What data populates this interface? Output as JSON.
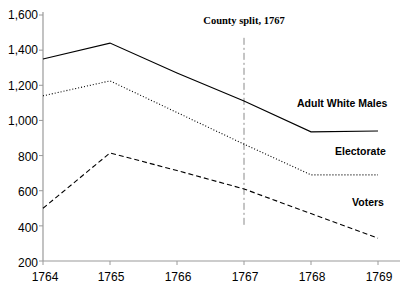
{
  "chart_data": {
    "type": "line",
    "title": "",
    "subtitle": "",
    "xlabel": "",
    "ylabel": "",
    "categories": [
      "1764",
      "1765",
      "1766",
      "1767",
      "1768",
      "1769"
    ],
    "x": [
      1764,
      1765,
      1766,
      1767,
      1768,
      1769
    ],
    "xlim": [
      1764,
      1769
    ],
    "ylim": [
      200,
      1600
    ],
    "ytick_labels": [
      "1,600",
      "1,400",
      "1,200",
      "1,000",
      "800",
      "600",
      "400",
      "200"
    ],
    "ytick_values": [
      1600,
      1400,
      1200,
      1000,
      800,
      600,
      400,
      200
    ],
    "grid": false,
    "legend_position": "inline-right",
    "series": [
      {
        "name": "Adult White Males",
        "style": "solid",
        "color": "#000000",
        "values": [
          1350,
          1440,
          1270,
          1110,
          935,
          940
        ]
      },
      {
        "name": "Electorate",
        "style": "dotted",
        "color": "#000000",
        "values": [
          1140,
          1225,
          1045,
          865,
          690,
          690
        ]
      },
      {
        "name": "Voters",
        "style": "dashed",
        "color": "#000000",
        "values": [
          500,
          815,
          715,
          610,
          470,
          330
        ]
      }
    ],
    "annotations": [
      {
        "text": "County split, 1767",
        "x": 1767,
        "style": "vertical-dash-dot-line",
        "line_y_from": 1470,
        "line_y_to": 400
      }
    ]
  },
  "axes": {
    "y_axis_name": "value-axis",
    "x_axis_name": "year-axis"
  }
}
